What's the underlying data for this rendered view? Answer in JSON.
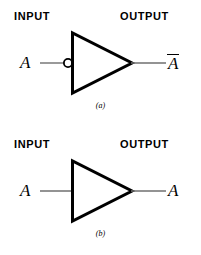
{
  "figure_a": {
    "input_header": "INPUT",
    "output_header": "OUTPUT",
    "input_signal": "A",
    "output_signal": "A",
    "output_overbar": true,
    "caption": "(a)",
    "gate_type": "inverter",
    "has_bubble": true
  },
  "figure_b": {
    "input_header": "INPUT",
    "output_header": "OUTPUT",
    "input_signal": "A",
    "output_signal": "A",
    "output_overbar": false,
    "caption": "(b)",
    "gate_type": "buffer",
    "has_bubble": false
  },
  "colors": {
    "background": "#ffffff",
    "stroke": "#000000",
    "wire": "#6f6f6f"
  }
}
